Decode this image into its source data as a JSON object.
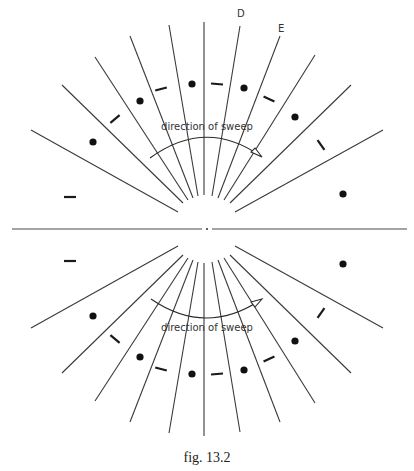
{
  "figure": {
    "caption": "fig. 13.2",
    "upper_panel": {
      "sweep_label": "direction of sweep",
      "sweep_direction": "clockwise (left to right)",
      "ray_count": 11,
      "ray_labels": [
        {
          "ray_index": 6,
          "text": "D"
        },
        {
          "ray_index": 7,
          "text": "E"
        }
      ],
      "markers_between_rays": [
        "dash",
        "dot",
        "dash",
        "dot",
        "dash",
        "dot",
        "dash",
        "dot",
        "dash",
        "dot"
      ]
    },
    "lower_panel": {
      "sweep_label": "direction of sweep",
      "sweep_direction": "counter-clockwise as viewed (left to right, below axis)",
      "ray_count": 11,
      "markers_between_rays": [
        "dash",
        "dot",
        "dash",
        "dot",
        "dash",
        "dot",
        "dash",
        "dot",
        "dash",
        "dot"
      ]
    },
    "colors": {
      "ink": "#1a1a1a",
      "background": "#ffffff"
    }
  }
}
